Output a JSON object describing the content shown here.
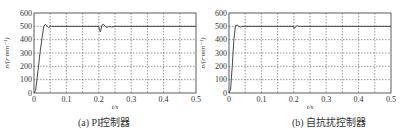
{
  "chart_data": [
    {
      "type": "line",
      "title": "",
      "caption": "(a) PI控制器",
      "xlabel": "t/s",
      "ylabel": "n/(r·min⁻¹)",
      "xlim": [
        0,
        0.5
      ],
      "ylim": [
        0,
        600
      ],
      "xticks": [
        "0",
        "0.1",
        "0.2",
        "0.3",
        "0.4",
        "0.5"
      ],
      "yticks": [
        "0",
        "100",
        "200",
        "300",
        "400",
        "500",
        "600"
      ],
      "grid": true,
      "legend": null,
      "series": [
        {
          "name": "speed",
          "x": [
            0,
            0.005,
            0.01,
            0.02,
            0.03,
            0.035,
            0.04,
            0.045,
            0.05,
            0.055,
            0.2,
            0.202,
            0.205,
            0.21,
            0.215,
            0.22,
            0.225,
            0.23,
            0.24,
            0.25,
            0.5
          ],
          "y": [
            0,
            20,
            120,
            330,
            500,
            515,
            505,
            490,
            500,
            500,
            500,
            470,
            460,
            510,
            515,
            500,
            490,
            500,
            495,
            500,
            500
          ]
        }
      ]
    },
    {
      "type": "line",
      "title": "",
      "caption": "(b) 自抗扰控制器",
      "xlabel": "t/s",
      "ylabel": "n/(r·min⁻¹)",
      "xlim": [
        0,
        0.5
      ],
      "ylim": [
        0,
        600
      ],
      "xticks": [
        "0",
        "0.1",
        "0.2",
        "0.3",
        "0.4",
        "0.5"
      ],
      "yticks": [
        "0",
        "100",
        "200",
        "300",
        "400",
        "500",
        "600"
      ],
      "grid": true,
      "legend": null,
      "series": [
        {
          "name": "speed",
          "x": [
            0,
            0.005,
            0.01,
            0.015,
            0.02,
            0.025,
            0.03,
            0.035,
            0.04,
            0.05,
            0.2,
            0.201,
            0.205,
            0.21,
            0.215,
            0.22,
            0.5
          ],
          "y": [
            0,
            30,
            200,
            400,
            505,
            510,
            500,
            495,
            500,
            500,
            500,
            485,
            495,
            505,
            500,
            500,
            500
          ]
        }
      ]
    }
  ],
  "panels": [
    {
      "caption": "(a) PI控制器",
      "xlabel": "t/s",
      "ylabel": "n/(r·min⁻¹)"
    },
    {
      "caption": "(b) 自抗扰控制器",
      "xlabel": "t/s",
      "ylabel": "n/(r·min⁻¹)"
    }
  ],
  "colors": {
    "line": "#333333",
    "grid": "#555555",
    "frame": "#333333"
  }
}
